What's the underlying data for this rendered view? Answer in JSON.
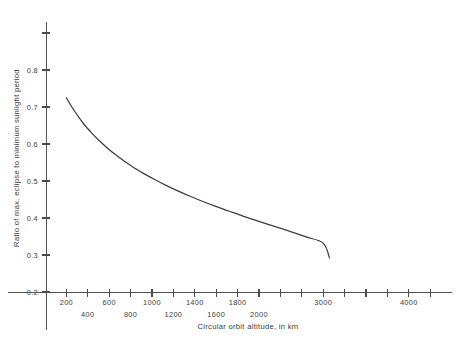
{
  "chart_data": {
    "type": "line",
    "title": "",
    "xlabel": "Circular orbit altitude, in km",
    "ylabel": "Ratio of max. eclipse to minimum sunlight period",
    "xlim": [
      0,
      4400
    ],
    "ylim": [
      0.2,
      0.9
    ],
    "grid": false,
    "legend": "none",
    "x_ticks_all": [
      200,
      400,
      600,
      800,
      1000,
      1200,
      1400,
      1600,
      1800,
      2000,
      2200,
      2400,
      2600,
      2800,
      3000,
      3200,
      3400,
      3600,
      3800,
      4000,
      4200
    ],
    "x_tick_labels_upper": [
      "200",
      "600",
      "1000",
      "1400",
      "1800",
      "3000",
      "4000"
    ],
    "x_tick_labels_lower": [
      "400",
      "800",
      "1200",
      "1600",
      "2000"
    ],
    "y_ticks": [
      0.2,
      0.3,
      0.4,
      0.5,
      0.6,
      0.7,
      0.8,
      0.9
    ],
    "y_tick_labels": [
      "0.2",
      "0.3",
      "0.4",
      "0.5",
      "0.6",
      "0.7",
      "0.8"
    ],
    "series": [
      {
        "name": "Ratio of max. eclipse to minimum sunlight period",
        "x": [
          200,
          260,
          330,
          400,
          480,
          560,
          650,
          740,
          840,
          950,
          1060,
          1180,
          1300,
          1430,
          1560,
          1700,
          1850,
          2000,
          2160,
          2320,
          2500,
          2680,
          2860,
          3050,
          3120
        ],
        "values": [
          0.725,
          0.7,
          0.675,
          0.652,
          0.63,
          0.61,
          0.59,
          0.572,
          0.554,
          0.536,
          0.52,
          0.504,
          0.489,
          0.474,
          0.46,
          0.446,
          0.432,
          0.419,
          0.405,
          0.392,
          0.378,
          0.364,
          0.349,
          0.332,
          0.292
        ]
      }
    ]
  },
  "caption": {
    "cut_off_text": ""
  },
  "colors": {
    "curve": "#3c3c42",
    "axis": "#55555a",
    "text": "#3a3a40",
    "background": "#ffffff"
  }
}
